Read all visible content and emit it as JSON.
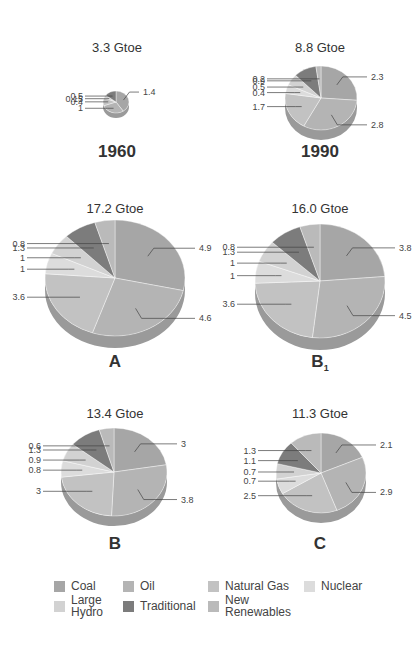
{
  "chart_data": {
    "type": "pie",
    "categories": [
      "Coal",
      "Oil",
      "Natural Gas",
      "Nuclear",
      "Large Hydro",
      "Traditional",
      "New Renewables"
    ],
    "colors": [
      "#a6a6a6",
      "#b4b4b4",
      "#c2c2c2",
      "#dcdcdc",
      "#d2d2d2",
      "#7c7c7c",
      "#bababa"
    ],
    "legend_position": "bottom",
    "units": "Gtoe",
    "charts": [
      {
        "id": "1960",
        "caption": "1960",
        "total": "3.3 Gtoe",
        "values": {
          "Coal": 1.4,
          "Oil": 1.0,
          "Natural Gas": 0.4,
          "Nuclear": 0.0,
          "Large Hydro": 0.15,
          "Traditional": 0.5,
          "New Renewables": 0.0
        },
        "labels": [
          "1.4",
          "1.0",
          "0.4",
          "0.15",
          "0.5"
        ]
      },
      {
        "id": "1990",
        "caption": "1990",
        "total": "8.8 Gtoe",
        "values": {
          "Coal": 2.3,
          "Oil": 2.8,
          "Natural Gas": 1.7,
          "Nuclear": 0.4,
          "Large Hydro": 0.5,
          "Traditional": 0.9,
          "New Renewables": 0.2
        },
        "labels": [
          "2.3",
          "2.8",
          "1.7",
          "0.4",
          "0.5",
          "0.9",
          "0.2"
        ]
      },
      {
        "id": "A",
        "caption": "A",
        "total": "17.2 Gtoe",
        "values": {
          "Coal": 4.9,
          "Oil": 4.6,
          "Natural Gas": 3.6,
          "Nuclear": 1.0,
          "Large Hydro": 1.0,
          "Traditional": 1.3,
          "New Renewables": 0.8
        },
        "labels": [
          "4.9",
          "4.6",
          "3.6",
          "1.0",
          "1.0",
          "1.3",
          "0.8"
        ]
      },
      {
        "id": "B1",
        "caption": "B",
        "caption_sub": "1",
        "total": "16.0 Gtoe",
        "values": {
          "Coal": 3.8,
          "Oil": 4.5,
          "Natural Gas": 3.6,
          "Nuclear": 1.0,
          "Large Hydro": 1.0,
          "Traditional": 1.3,
          "New Renewables": 0.8
        },
        "labels": [
          "3.8",
          "4.5",
          "3.6",
          "1.0",
          "1.0",
          "1.3",
          "0.8"
        ]
      },
      {
        "id": "B",
        "caption": "B",
        "total": "13.4 Gtoe",
        "values": {
          "Coal": 3.0,
          "Oil": 3.8,
          "Natural Gas": 3.0,
          "Nuclear": 0.8,
          "Large Hydro": 0.9,
          "Traditional": 1.3,
          "New Renewables": 0.6
        },
        "labels": [
          "3.0",
          "3.8",
          "3.0",
          "0.8",
          "0.9",
          "1.3",
          "0.6"
        ]
      },
      {
        "id": "C",
        "caption": "C",
        "total": "11.3 Gtoe",
        "values": {
          "Coal": 2.1,
          "Oil": 2.9,
          "Natural Gas": 2.5,
          "Nuclear": 0.7,
          "Large Hydro": 0.7,
          "Traditional": 1.1,
          "New Renewables": 1.3
        },
        "labels": [
          "2.1",
          "2.9",
          "2.5",
          "0.7",
          "0.7",
          "1.1",
          "1.3"
        ]
      }
    ]
  },
  "panels": {
    "p1960": {
      "total": "3.3 Gtoe",
      "caption": "1960"
    },
    "p1990": {
      "total": "8.8 Gtoe",
      "caption": "1990"
    },
    "pA": {
      "total": "17.2 Gtoe",
      "caption": "A"
    },
    "pB1": {
      "total": "16.0 Gtoe",
      "caption": "B",
      "caption_sub": "1"
    },
    "pB": {
      "total": "13.4 Gtoe",
      "caption": "B"
    },
    "pC": {
      "total": "11.3 Gtoe",
      "caption": "C"
    }
  },
  "legend": {
    "items": [
      {
        "label": "Coal",
        "color": "#a6a6a6"
      },
      {
        "label": "Oil",
        "color": "#b4b4b4"
      },
      {
        "label": "Natural Gas",
        "color": "#c2c2c2"
      },
      {
        "label": "Nuclear",
        "color": "#dcdcdc"
      },
      {
        "label_line1": "Large",
        "label_line2": "Hydro",
        "color": "#d2d2d2"
      },
      {
        "label": "Traditional",
        "color": "#7c7c7c"
      },
      {
        "label_line1": "New",
        "label_line2": "Renewables",
        "color": "#bababa"
      }
    ]
  }
}
